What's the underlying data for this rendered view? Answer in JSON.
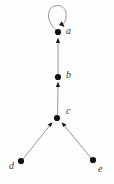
{
  "figure": {
    "kind": "directed-graph",
    "background_color": "#fefefe",
    "edge_color": "#8a8a8c",
    "node_color": "#111111",
    "label_color": "#39393b",
    "node_radius": 3.1,
    "edge_width": 0.9
  },
  "nodes": [
    {
      "id": "a",
      "label": "a",
      "x": 58,
      "y": 32,
      "label_x": 66,
      "label_y": 29
    },
    {
      "id": "b",
      "label": "b",
      "x": 58,
      "y": 77,
      "label_x": 66,
      "label_y": 72
    },
    {
      "id": "c",
      "label": "c",
      "x": 57,
      "y": 118,
      "label_x": 66,
      "label_y": 108
    },
    {
      "id": "d",
      "label": "d",
      "x": 21,
      "y": 161,
      "label_x": 10,
      "label_y": 163
    },
    {
      "id": "e",
      "label": "e",
      "x": 93,
      "y": 160,
      "label_x": 99,
      "label_y": 165
    }
  ],
  "edges": [
    {
      "id": "a-a",
      "from": "a",
      "to": "a",
      "type": "self-loop",
      "arrow": true
    },
    {
      "id": "b-a",
      "from": "b",
      "to": "a",
      "type": "straight",
      "arrow": true
    },
    {
      "id": "c-b",
      "from": "c",
      "to": "b",
      "type": "straight",
      "arrow": true
    },
    {
      "id": "d-c",
      "from": "d",
      "to": "c",
      "type": "straight",
      "arrow": true
    },
    {
      "id": "e-c",
      "from": "e",
      "to": "c",
      "type": "straight",
      "arrow": true
    }
  ],
  "labels": {
    "a": "a",
    "b": "b",
    "c": "c",
    "d": "d",
    "e": "e"
  }
}
